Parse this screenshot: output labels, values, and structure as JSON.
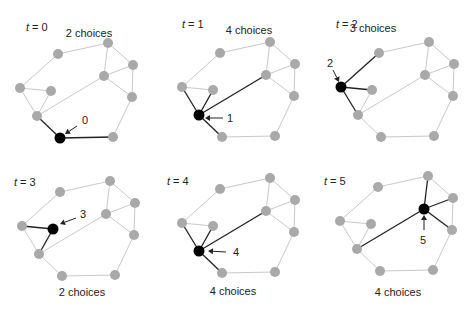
{
  "figure": {
    "colors": {
      "node": "#a9a9a9",
      "current_node": "#000000",
      "edge": "#c9c9c9",
      "highlight_edge": "#222222",
      "text": "#222222"
    },
    "graph": {
      "nodes": {
        "A": [
          38,
          -34
        ],
        "B": [
          88,
          -45
        ],
        "C": [
          113,
          -23
        ],
        "D": [
          84,
          -12
        ],
        "E": [
          0,
          0
        ],
        "F": [
          31,
          3
        ],
        "G": [
          112,
          9
        ],
        "H": [
          17,
          28
        ],
        "I": [
          40,
          50
        ],
        "J": [
          93,
          49
        ]
      },
      "edges": [
        [
          "A",
          "B"
        ],
        [
          "A",
          "E"
        ],
        [
          "B",
          "C"
        ],
        [
          "B",
          "D"
        ],
        [
          "C",
          "D"
        ],
        [
          "C",
          "G"
        ],
        [
          "D",
          "G"
        ],
        [
          "D",
          "H"
        ],
        [
          "E",
          "F"
        ],
        [
          "E",
          "H"
        ],
        [
          "F",
          "H"
        ],
        [
          "H",
          "I"
        ],
        [
          "I",
          "J"
        ],
        [
          "J",
          "G"
        ]
      ]
    },
    "panels": [
      {
        "t_label": "t = 0",
        "t_var": "t",
        "t_value": "0",
        "choices_label": "2 choices",
        "current": "I",
        "step_label": "0",
        "origin": [
          20,
          88
        ],
        "title_pos": [
          26,
          31
        ],
        "choices_pos": [
          89,
          37
        ],
        "arrow": {
          "from": [
            77,
            126
          ],
          "to": [
            65,
            134
          ]
        },
        "step_pos": [
          82,
          124
        ]
      },
      {
        "t_label": "t = 1",
        "t_var": "t",
        "t_value": "1",
        "choices_label": "4 choices",
        "current": "H",
        "step_label": "1",
        "origin": [
          182,
          87
        ],
        "title_pos": [
          182,
          28
        ],
        "choices_pos": [
          249,
          34
        ],
        "arrow": {
          "from": [
            223,
            118
          ],
          "to": [
            205,
            118
          ]
        },
        "step_pos": [
          227,
          122
        ]
      },
      {
        "t_label": "t = 2",
        "t_var": "t",
        "t_value": "2",
        "choices_label": "3 choices",
        "current": "E",
        "step_label": "2",
        "origin": [
          341,
          87
        ],
        "title_pos": [
          336,
          28
        ],
        "choices_pos": [
          373,
          32
        ],
        "arrow": {
          "from": [
            333,
            70
          ],
          "to": [
            339,
            82
          ]
        },
        "step_pos": [
          327,
          67
        ]
      },
      {
        "t_label": "t = 3",
        "t_var": "t",
        "t_value": "3",
        "choices_label": "2 choices",
        "current": "F",
        "step_label": "3",
        "origin": [
          22,
          226
        ],
        "title_pos": [
          14,
          186
        ],
        "choices_pos": [
          82,
          296
        ],
        "arrow": {
          "from": [
            76,
            218
          ],
          "to": [
            60,
            224
          ]
        },
        "step_pos": [
          80,
          218
        ]
      },
      {
        "t_label": "t = 4",
        "t_var": "t",
        "t_value": "4",
        "choices_label": "4 choices",
        "current": "H",
        "step_label": "4",
        "origin": [
          182,
          223
        ],
        "title_pos": [
          167,
          185
        ],
        "choices_pos": [
          233,
          295
        ],
        "arrow": {
          "from": [
            226,
            252
          ],
          "to": [
            208,
            251
          ]
        },
        "step_pos": [
          233,
          256
        ]
      },
      {
        "t_label": "t = 5",
        "t_var": "t",
        "t_value": "5",
        "choices_label": "4 choices",
        "current": "D",
        "step_label": "5",
        "origin": [
          340,
          221
        ],
        "title_pos": [
          324,
          185
        ],
        "choices_pos": [
          398,
          296
        ],
        "arrow": {
          "from": [
            424,
            230
          ],
          "to": [
            424,
            215
          ]
        },
        "step_pos": [
          420,
          244
        ]
      }
    ]
  }
}
